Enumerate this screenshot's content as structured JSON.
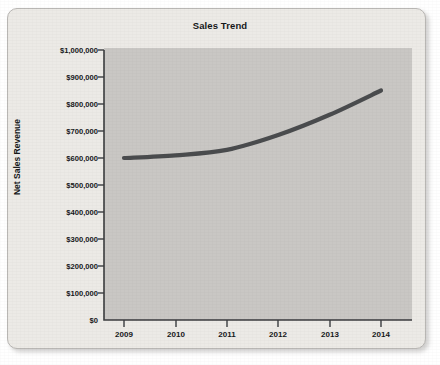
{
  "chart_data": {
    "type": "line",
    "title": "Sales Trend",
    "xlabel": "",
    "ylabel": "Net Sales Revenue",
    "categories": [
      "2009",
      "2010",
      "2011",
      "2012",
      "2013",
      "2014"
    ],
    "x": [
      2009,
      2010,
      2011,
      2012,
      2013,
      2014
    ],
    "values": [
      600000,
      610000,
      630000,
      685000,
      760000,
      850000
    ],
    "series": [
      {
        "name": "Net Sales Revenue",
        "values": [
          600000,
          610000,
          630000,
          685000,
          760000,
          850000
        ]
      }
    ],
    "ylim": [
      0,
      1000000
    ],
    "ytick_values": [
      0,
      100000,
      200000,
      300000,
      400000,
      500000,
      600000,
      700000,
      800000,
      900000,
      1000000
    ],
    "ytick_labels": [
      "$0",
      "$100,000",
      "$200,000",
      "$300,000",
      "$400,000",
      "$500,000",
      "$600,000",
      "$700,000",
      "$800,000",
      "$900,000",
      "$1,000,000"
    ],
    "xtick_labels": [
      "2009",
      "2010",
      "2011",
      "2012",
      "2013",
      "2014"
    ],
    "grid": false,
    "legend": false,
    "legend_position": "none",
    "annotations": [],
    "colors": {
      "line": "#4a4c4e",
      "plot_background": "#c9c7c4",
      "card_background": "#eceae6",
      "axis": "#3b3d3f",
      "text": "#16181a"
    }
  }
}
